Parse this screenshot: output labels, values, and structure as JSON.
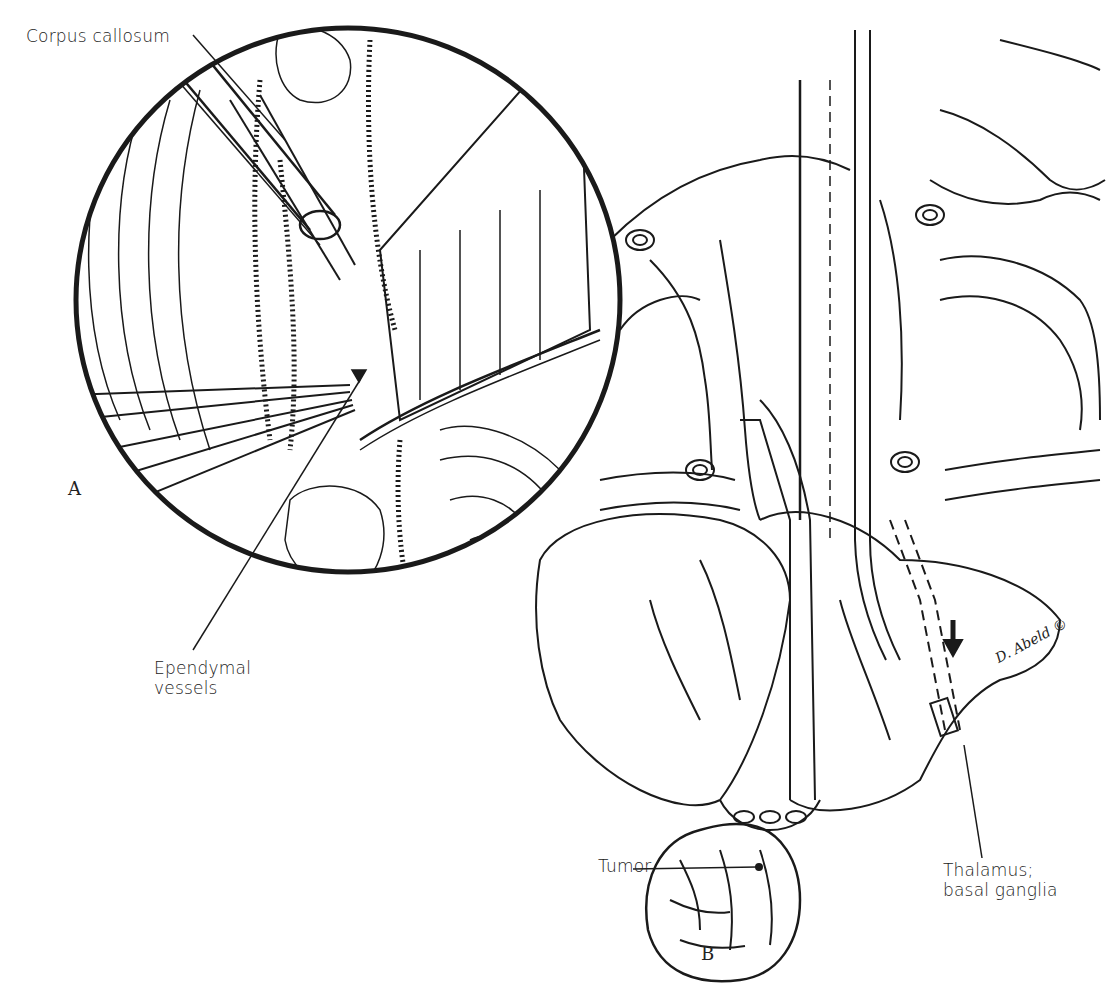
{
  "figure": {
    "panels": [
      {
        "id": "A",
        "letter": "A",
        "description": "magnified circular inset view of surgical field"
      },
      {
        "id": "B",
        "letter": "B",
        "description": "coronal section of brain showing approach to tumor"
      }
    ],
    "labels": {
      "corpus_callosum": "Corpus callosum",
      "ependymal_line1": "Ependymal",
      "ependymal_line2": "vessels",
      "tumor": "Tumor",
      "thalamus_line1": "Thalamus;",
      "thalamus_line2": "basal ganglia"
    },
    "signature": "D. Abeld",
    "copyright_symbol": "©",
    "colors": {
      "ink": "#1a1a1a",
      "paper": "#ffffff"
    }
  }
}
